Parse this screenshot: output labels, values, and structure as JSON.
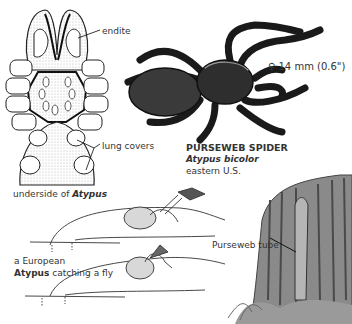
{
  "figure": {
    "colors": {
      "ink": "#2a2a2a",
      "spider_body": "#3a3a3a",
      "stump": "#8a8a8a",
      "background": "#ffffff"
    }
  },
  "underside_panel": {
    "labels": {
      "endite": "endite",
      "lung_covers": "lung covers",
      "caption_prefix": "underside of ",
      "caption_genus": "Atypus"
    }
  },
  "species_panel": {
    "size": "♀ 14 mm (0.6\")",
    "common_name": "PURSEWEB SPIDER",
    "scientific_name": "Atypus bicolor",
    "range": "eastern U.S."
  },
  "behavior_panel": {
    "caption_line1": "a European",
    "caption_genus": "Atypus",
    "caption_rest": " catching a fly"
  },
  "habitat_panel": {
    "label": "Purseweb tube"
  }
}
